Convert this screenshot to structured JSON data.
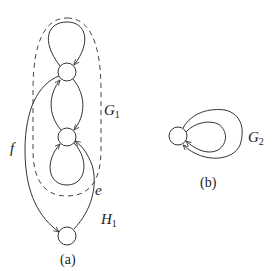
{
  "diagram": {
    "stroke_color": "#333333",
    "background": "#ffffff",
    "subfigures": [
      {
        "id": "a",
        "caption": "(a)",
        "nodes": [
          {
            "id": "top",
            "cx": 67,
            "cy": 72,
            "r": 9
          },
          {
            "id": "middle",
            "cx": 67,
            "cy": 137,
            "r": 9
          },
          {
            "id": "bottom",
            "cx": 67,
            "cy": 236,
            "r": 9
          }
        ],
        "edges": [
          {
            "from": "top",
            "to": "top",
            "kind": "loop",
            "label": ""
          },
          {
            "from": "top",
            "to": "middle",
            "kind": "arc-right",
            "label": ""
          },
          {
            "from": "middle",
            "to": "top",
            "kind": "arc-left",
            "label": ""
          },
          {
            "from": "middle",
            "to": "middle",
            "kind": "loop-down",
            "label": ""
          },
          {
            "from": "top",
            "to": "bottom",
            "kind": "curve",
            "label": "f"
          },
          {
            "from": "bottom",
            "to": "middle",
            "kind": "curve",
            "label": "e"
          }
        ],
        "regions": [
          {
            "label_main": "G",
            "label_sub": "1",
            "style": "dashed-ellipse"
          }
        ],
        "labels": {
          "f": "f",
          "e": "e",
          "G_main": "G",
          "G_sub": "1",
          "H_main": "H",
          "H_sub": "1"
        }
      },
      {
        "id": "b",
        "caption": "(b)",
        "nodes": [
          {
            "id": "single",
            "cx": 178,
            "cy": 136,
            "r": 9
          }
        ],
        "edges": [
          {
            "from": "single",
            "to": "single",
            "kind": "loop-inner",
            "label": ""
          },
          {
            "from": "single",
            "to": "single",
            "kind": "loop-outer",
            "label": ""
          }
        ],
        "labels": {
          "G_main": "G",
          "G_sub": "2"
        }
      }
    ]
  }
}
